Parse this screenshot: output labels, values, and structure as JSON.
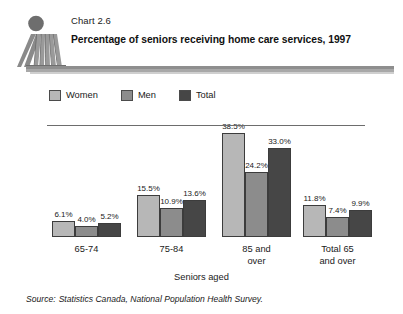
{
  "header": {
    "chart_number": "Chart 2.6",
    "title": "Percentage of seniors receiving home care services, 1997",
    "logo_icon": "statistics-canada-figure-logo"
  },
  "legend": {
    "items": [
      {
        "label": "Women",
        "color": "#b7b7b7"
      },
      {
        "label": "Men",
        "color": "#8c8c8c"
      },
      {
        "label": "Total",
        "color": "#464646"
      }
    ]
  },
  "axis": {
    "title": "Seniors aged",
    "categories": [
      "65-74",
      "75-84",
      "85 and over",
      "Total 65 and over"
    ],
    "category_lines": [
      [
        "65-74"
      ],
      [
        "75-84"
      ],
      [
        "85 and",
        "over"
      ],
      [
        "Total 65",
        "and over"
      ]
    ]
  },
  "source": {
    "label": "Source:",
    "text": "Statistics Canada, National Population Health Survey."
  },
  "chart_data": {
    "type": "bar",
    "title": "Percentage of seniors receiving home care services, 1997",
    "subtitle": "Chart 2.6",
    "xlabel": "Seniors aged",
    "ylabel": "",
    "ylim": [
      0,
      40
    ],
    "grid": false,
    "legend_position": "top-left",
    "value_labels": true,
    "value_suffix": "%",
    "categories": [
      "65-74",
      "75-84",
      "85 and over",
      "Total 65 and over"
    ],
    "series": [
      {
        "name": "Women",
        "color": "#b7b7b7",
        "values": [
          6.1,
          15.5,
          38.5,
          11.8
        ],
        "labels": [
          "6.1%",
          "15.5%",
          "38.5%",
          "11.8%"
        ]
      },
      {
        "name": "Men",
        "color": "#8c8c8c",
        "values": [
          4.0,
          10.9,
          24.2,
          7.4
        ],
        "labels": [
          "4.0%",
          "10.9%",
          "24.2%",
          "7.4%"
        ]
      },
      {
        "name": "Total",
        "color": "#464646",
        "values": [
          5.2,
          13.6,
          33.0,
          9.9
        ],
        "labels": [
          "5.2%",
          "13.6%",
          "33.0%",
          "9.9%"
        ]
      }
    ],
    "source": "Source: Statistics Canada, National Population Health Survey."
  }
}
